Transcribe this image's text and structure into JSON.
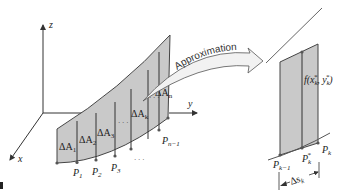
{
  "figure": {
    "colors": {
      "surface_fill": "#c9c9c9",
      "surface_stroke": "#444444",
      "axis": "#333333",
      "arrow_fill": "#f2f2f2",
      "tangent": "#555555"
    },
    "axes": {
      "z_label": "z",
      "y_label": "y",
      "x_label": "x"
    },
    "curtain_labels": {
      "dA1": "ΔA",
      "dA1_sub": "1",
      "dA2": "ΔA",
      "dA2_sub": "2",
      "dA3": "ΔA",
      "dA3_sub": "3",
      "dAk": "ΔA",
      "dAk_sub": "k",
      "dAn": "ΔA",
      "dAn_sub": "n",
      "dots": "· · ·"
    },
    "points": {
      "P1": "P",
      "P1_sub": "1",
      "P2": "P",
      "P2_sub": "2",
      "P3": "P",
      "P3_sub": "3",
      "Pn1": "P",
      "Pn1_sub": "n−1",
      "dots": "· · ·"
    },
    "approximation_label": "Approximation",
    "detail": {
      "height_label": "f(x",
      "height_sub": "k",
      "height_sup": "*",
      "height_mid": ", y",
      "height_end": ")",
      "Pk1": "P",
      "Pk1_sub": "k−1",
      "Pkstar": "P",
      "Pkstar_sub": "k",
      "Pkstar_sup": "*",
      "Pk": "P",
      "Pk_sub": "k",
      "ds": "Δs",
      "ds_sub": "k"
    }
  }
}
